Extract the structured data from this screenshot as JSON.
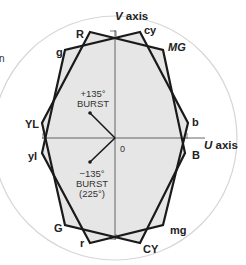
{
  "diagram": {
    "colors": {
      "background": "#ffffff",
      "circle": "#d8d8d8",
      "fill": "#e8e8e8",
      "stroke": "#1a1a1a",
      "axis": "#555555",
      "text": "#222222"
    },
    "axes": {
      "v_label_italic": "V",
      "v_label_rest": " axis",
      "u_label_italic": "U",
      "u_label_rest": " axis",
      "origin_label": "0"
    },
    "fragment_text": "n",
    "hexagon_upper": {
      "name": "100% color bars",
      "vertices": [
        {
          "label": "R",
          "x": 90,
          "y": 32
        },
        {
          "label": "MG",
          "x": 163,
          "y": 50
        },
        {
          "label": "B",
          "x": 185,
          "y": 153
        },
        {
          "label": "CY",
          "x": 140,
          "y": 243
        },
        {
          "label": "G",
          "x": 65,
          "y": 225
        },
        {
          "label": "YL",
          "x": 42,
          "y": 123
        }
      ]
    },
    "hexagon_lower": {
      "name": "complementary color bars",
      "vertices": [
        {
          "label": "cy",
          "x": 140,
          "y": 32
        },
        {
          "label": "b",
          "x": 188,
          "y": 123
        },
        {
          "label": "mg",
          "x": 163,
          "y": 225
        },
        {
          "label": "r",
          "x": 90,
          "y": 243
        },
        {
          "label": "yl",
          "x": 42,
          "y": 153
        },
        {
          "label": "g",
          "x": 65,
          "y": 50
        }
      ]
    },
    "burst": {
      "plus": {
        "line1": "+135°",
        "line2": "BURST"
      },
      "minus": {
        "line1": "−135°",
        "line2": "BURST",
        "line3": "(225°)"
      }
    }
  }
}
